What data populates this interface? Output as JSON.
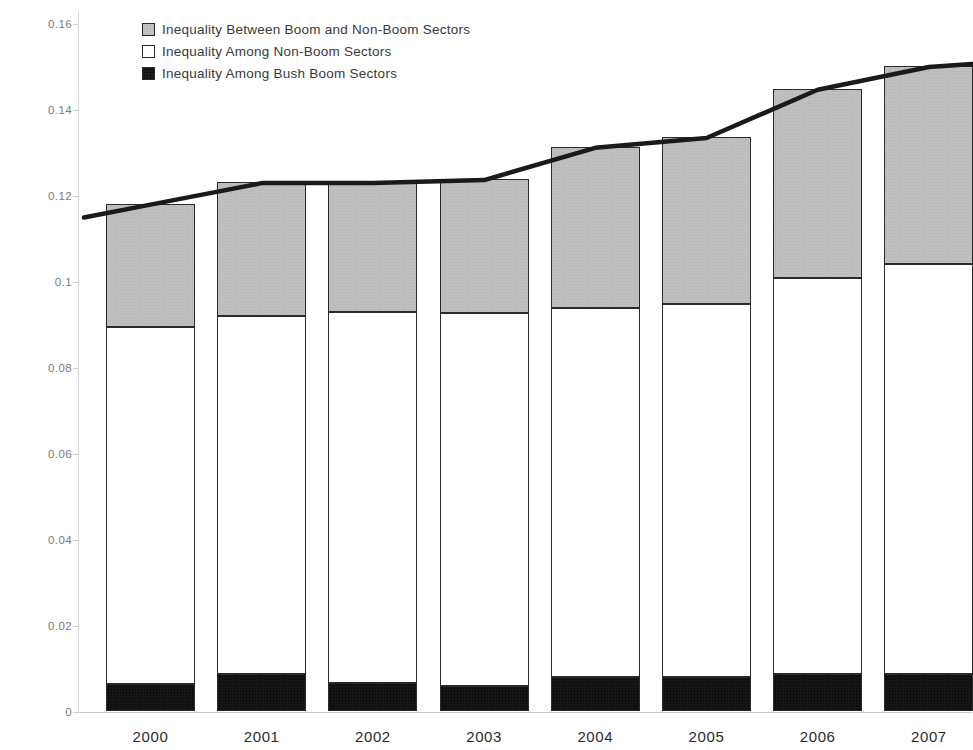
{
  "chart_data": {
    "type": "bar",
    "stacked": true,
    "title": "",
    "xlabel": "",
    "ylabel": "Theil's T Statistic of Between National Sector Earnings Inequality",
    "categories": [
      "2000",
      "2001",
      "2002",
      "2003",
      "2004",
      "2005",
      "2006",
      "2007"
    ],
    "ylim": [
      0,
      0.16
    ],
    "ytick_labels": [
      "0",
      "0.02",
      "0.04",
      "0.06",
      "0.08",
      "0.1",
      "0.12",
      "0.14",
      "0.16"
    ],
    "ytick_values": [
      0,
      0.02,
      0.04,
      0.06,
      0.08,
      0.1,
      0.12,
      0.14,
      0.16
    ],
    "grid": false,
    "legend_position": "top-left",
    "series": [
      {
        "name": "Inequality Among Bush Boom Sectors",
        "color": "#151515",
        "values": [
          0.0062,
          0.0085,
          0.0064,
          0.0059,
          0.0078,
          0.0078,
          0.0085,
          0.0085
        ]
      },
      {
        "name": "Inequality Among Non-Boom Sectors",
        "color": "#ffffff",
        "values": [
          0.0832,
          0.0834,
          0.0864,
          0.0867,
          0.0859,
          0.0868,
          0.0923,
          0.0955
        ]
      },
      {
        "name": "Inequality Between Boom and Non-Boom Sectors",
        "color": "#bfbfbf",
        "values": [
          0.0286,
          0.0311,
          0.0302,
          0.0311,
          0.0375,
          0.0389,
          0.0439,
          0.046
        ]
      }
    ],
    "stack_tops": {
      "black": [
        0.0062,
        0.0085,
        0.0064,
        0.0059,
        0.0078,
        0.0078,
        0.0085,
        0.0085
      ],
      "white": [
        0.0894,
        0.0919,
        0.0928,
        0.0926,
        0.0937,
        0.0946,
        0.1008,
        0.104
      ],
      "total": [
        0.118,
        0.123,
        0.123,
        0.1237,
        0.1312,
        0.1335,
        0.1447,
        0.15
      ]
    },
    "trend_line": {
      "name": "total-inequality-trend",
      "color": "#1a1a1a",
      "values": [
        0.118,
        0.123,
        0.123,
        0.1237,
        0.1312,
        0.1335,
        0.1447,
        0.15
      ]
    },
    "note": "Rightmost 2007 bar is cropped by the image edge."
  },
  "legend": {
    "items": [
      {
        "label": "Inequality Between Boom and Non-Boom Sectors",
        "swatch": "gray"
      },
      {
        "label": "Inequality Among Non-Boom Sectors",
        "swatch": "white"
      },
      {
        "label": "Inequality Among Bush Boom Sectors",
        "swatch": "black"
      }
    ]
  },
  "axes": {
    "y_title": "Theil's T Statistic of Between National Sector Earnings Inequality"
  }
}
